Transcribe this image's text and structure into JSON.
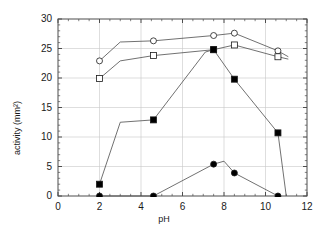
{
  "chart_data": {
    "type": "line",
    "title": "",
    "subtitle": "",
    "xlabel": "pH",
    "ylabel": "activity (mm²)",
    "xlim": [
      0,
      12
    ],
    "ylim": [
      0,
      30
    ],
    "xticks": [
      0,
      2,
      4,
      6,
      8,
      10,
      12
    ],
    "yticks": [
      0,
      5,
      10,
      15,
      20,
      25,
      30
    ],
    "xtick_labels": [
      "0",
      "2",
      "4",
      "6",
      "8",
      "10",
      "12"
    ],
    "ytick_labels": [
      "0",
      "5",
      "10",
      "15",
      "20",
      "25",
      "30"
    ],
    "x_minor_tick_step": 0.5,
    "y_minor_tick_step": 1,
    "grid": true,
    "grid_color": "#c8c8c8",
    "grid_style": "solid",
    "legend": false,
    "legend_position": "none",
    "frame": true,
    "frame_color": "#4d4d4d",
    "line_color": "#4d4d4d",
    "marker_edge_color": "#1a1a1a",
    "series": [
      {
        "name": "open-circle-series",
        "marker": "circle-open",
        "fill": "#ffffff",
        "x": [
          2.0,
          3.0,
          4.6,
          7.5,
          8.5,
          10.6,
          11.1
        ],
        "y": [
          22.9,
          26.1,
          26.3,
          27.2,
          27.6,
          24.6,
          23.6
        ]
      },
      {
        "name": "open-square-series",
        "marker": "square-open",
        "fill": "#ffffff",
        "x": [
          2.0,
          3.0,
          4.6,
          7.5,
          8.5,
          10.6,
          11.1
        ],
        "y": [
          19.9,
          22.9,
          23.8,
          24.8,
          25.6,
          23.6,
          23.2
        ]
      },
      {
        "name": "filled-square-series",
        "marker": "square-filled",
        "fill": "#000000",
        "x": [
          2.0,
          3.0,
          4.6,
          7.1,
          7.5,
          8.5,
          10.6,
          11.0
        ],
        "y": [
          2.0,
          12.5,
          12.9,
          24.4,
          24.8,
          19.8,
          10.7,
          0.0
        ]
      },
      {
        "name": "filled-circle-series",
        "marker": "circle-filled",
        "fill": "#000000",
        "x": [
          2.0,
          4.6,
          7.5,
          8.0,
          8.5,
          10.6
        ],
        "y": [
          0.0,
          0.0,
          5.4,
          5.9,
          3.9,
          0.0
        ]
      }
    ]
  },
  "plot_geometry": {
    "left_px": 58,
    "right_px": 307,
    "top_px": 19,
    "bottom_px": 196
  }
}
